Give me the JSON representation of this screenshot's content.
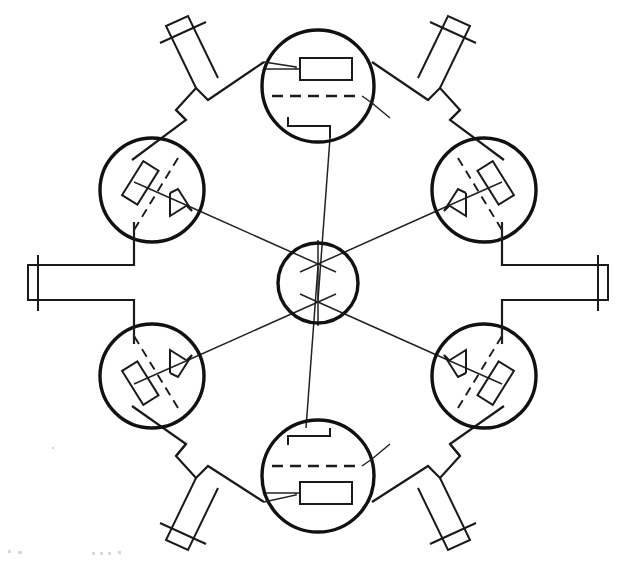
{
  "document": {
    "title": "Radial Rotary Distributor Valve — Plan Section",
    "drawing_type": "engineering-line-drawing",
    "background_color": "#ffffff",
    "line_color": "#111111",
    "caption_text": ""
  },
  "geometry": {
    "canvas": {
      "width": 625,
      "height": 562
    },
    "hub": {
      "cx": 318,
      "cy": 283,
      "r": 40,
      "label": "central-hub"
    },
    "chamber_radius_outer": 56,
    "chamber_radius_side": 52,
    "chambers": [
      {
        "id": "top",
        "cx": 318,
        "cy": 86,
        "r": 56,
        "angle_deg": 270,
        "port_angle_deg": 0,
        "type": "axial-chamber"
      },
      {
        "id": "upper-left",
        "cx": 152,
        "cy": 190,
        "r": 52,
        "angle_deg": 210,
        "port_angle_deg": 300,
        "type": "diagonal-chamber"
      },
      {
        "id": "upper-right",
        "cx": 484,
        "cy": 190,
        "r": 52,
        "angle_deg": 330,
        "port_angle_deg": 240,
        "type": "diagonal-chamber"
      },
      {
        "id": "lower-left",
        "cx": 152,
        "cy": 376,
        "r": 52,
        "angle_deg": 150,
        "port_angle_deg": 60,
        "type": "diagonal-chamber"
      },
      {
        "id": "lower-right",
        "cx": 484,
        "cy": 376,
        "r": 52,
        "angle_deg": 30,
        "port_angle_deg": 120,
        "type": "diagonal-chamber"
      },
      {
        "id": "bottom",
        "cx": 318,
        "cy": 476,
        "r": 56,
        "angle_deg": 90,
        "port_angle_deg": 180,
        "type": "axial-chamber"
      }
    ],
    "nozzles": [
      {
        "id": "nozzle-upper-left",
        "angle_deg": 225,
        "length": 95,
        "width": 18,
        "flange": true
      },
      {
        "id": "nozzle-upper-right",
        "angle_deg": 315,
        "length": 95,
        "width": 18,
        "flange": true
      },
      {
        "id": "nozzle-left",
        "angle_deg": 180,
        "length": 95,
        "width": 22,
        "flange": true
      },
      {
        "id": "nozzle-right",
        "angle_deg": 0,
        "length": 95,
        "width": 22,
        "flange": true
      },
      {
        "id": "nozzle-lower-left",
        "angle_deg": 135,
        "length": 95,
        "width": 18,
        "flange": true
      },
      {
        "id": "nozzle-lower-right",
        "angle_deg": 45,
        "length": 95,
        "width": 18,
        "flange": true
      }
    ],
    "hub_spokes": 6,
    "spoke_angles_deg": [
      30,
      90,
      150,
      210,
      270,
      330
    ]
  },
  "legend": {
    "heavy_line": "chamber-bore-outline",
    "medium_line": "valve-body-outline",
    "thin_line": "spoke-linkage",
    "dashed_line": "centerline-axis",
    "small_rect": "sliding-vane-block",
    "hook_shape": "port-seat-bracket"
  },
  "annotations": {
    "hub_label": "",
    "chamber_labels": [
      "",
      "",
      "",
      "",
      "",
      ""
    ],
    "nozzle_labels": [
      "",
      "",
      "",
      "",
      "",
      ""
    ]
  }
}
